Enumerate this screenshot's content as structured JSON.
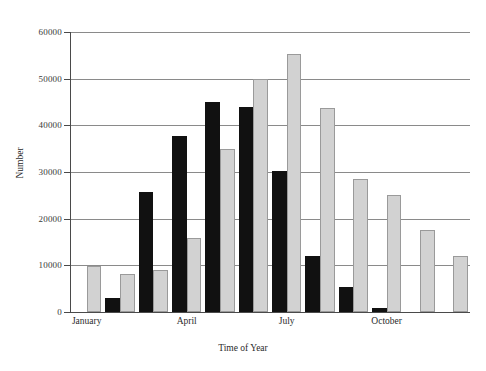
{
  "chart_data": {
    "type": "bar",
    "title": "",
    "xlabel": "Time of Year",
    "ylabel": "Number",
    "ylim": [
      0,
      60000
    ],
    "ytick_labels": [
      "0",
      "10000",
      "20000",
      "30000",
      "40000",
      "50000",
      "60000"
    ],
    "ytick_values": [
      0,
      10000,
      20000,
      30000,
      40000,
      50000,
      60000
    ],
    "grid": true,
    "legend": "none",
    "categories": [
      "January",
      "February",
      "March",
      "April",
      "May",
      "June",
      "July",
      "August",
      "September",
      "October",
      "November",
      "December"
    ],
    "visible_tick_labels": [
      "January",
      "April",
      "July",
      "October"
    ],
    "visible_tick_indices": [
      0,
      3,
      6,
      9
    ],
    "series": [
      {
        "name": "black",
        "color": "#111111",
        "values": [
          null,
          3000,
          25800,
          37800,
          45000,
          44000,
          30200,
          12000,
          5300,
          800,
          null,
          null
        ]
      },
      {
        "name": "gray",
        "color": "#d2d2d2",
        "values": [
          9900,
          8100,
          9000,
          15800,
          35000,
          50000,
          55200,
          43800,
          28400,
          25000,
          17500,
          12000
        ]
      }
    ]
  }
}
